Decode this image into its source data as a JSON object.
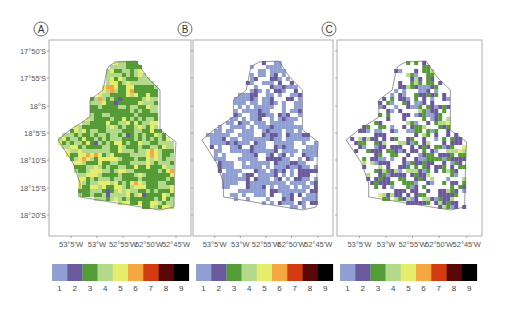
{
  "chart_data": {
    "type": "heatmap",
    "title": "",
    "classes": [
      1,
      2,
      3,
      4,
      5,
      6,
      7,
      8,
      9
    ],
    "class_colors": [
      "#8f9fd1",
      "#6a5a9b",
      "#569c36",
      "#b2d98c",
      "#e6ec6b",
      "#f6a741",
      "#d63a10",
      "#5a0707",
      "#000000"
    ],
    "y_ticks": [
      "17°50'S",
      "17°55'S",
      "18°S",
      "18°5'S",
      "18°10'S",
      "18°15'S",
      "18°20'S"
    ],
    "x_ticks": [
      "53°5'W",
      "53°W",
      "52°55'W",
      "52°50'W",
      "52°45'W"
    ],
    "panels": [
      {
        "label": "A",
        "class_weights": [
          0.06,
          0.1,
          0.28,
          0.24,
          0.14,
          0.08,
          0.06,
          0.02,
          0.02
        ],
        "fill_fraction": 1.0
      },
      {
        "label": "B",
        "class_weights": [
          0.68,
          0.22,
          0.05,
          0.02,
          0.02,
          0.005,
          0.003,
          0.001,
          0.001
        ],
        "fill_fraction": 0.62
      },
      {
        "label": "C",
        "class_weights": [
          0.34,
          0.26,
          0.16,
          0.08,
          0.07,
          0.04,
          0.03,
          0.01,
          0.01
        ],
        "fill_fraction": 0.55
      }
    ],
    "legend": {
      "placement": "bottom",
      "labels": [
        "1",
        "2",
        "3",
        "4",
        "5",
        "6",
        "7",
        "8",
        "9"
      ]
    }
  }
}
